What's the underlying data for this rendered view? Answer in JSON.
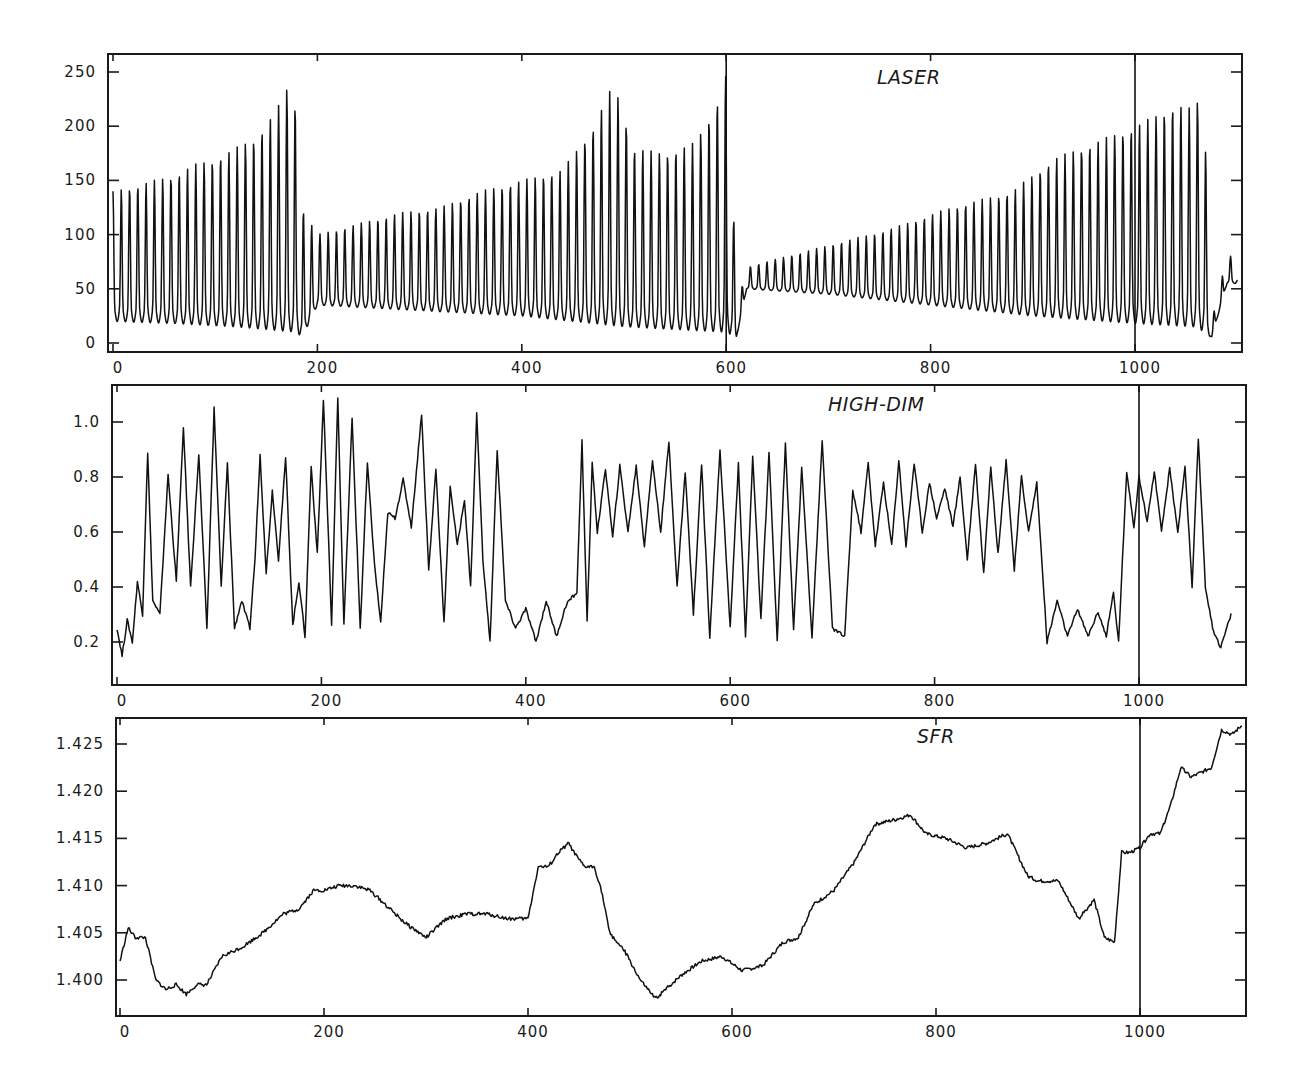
{
  "figure": {
    "panels": [
      {
        "id": "laser",
        "title": "LASER"
      },
      {
        "id": "high-dim",
        "title": "HIGH-DIM"
      },
      {
        "id": "sfr",
        "title": "SFR"
      }
    ]
  },
  "chart_data": [
    {
      "type": "line",
      "title": "LASER",
      "xlabel": "",
      "ylabel": "",
      "xlim": [
        0,
        1100
      ],
      "ylim": [
        -8,
        262
      ],
      "x_ticks": [
        0,
        200,
        400,
        600,
        800,
        1000
      ],
      "y_ticks": [
        0,
        50,
        100,
        150,
        200,
        250
      ],
      "grid": false,
      "vertical_markers": [
        600,
        1000
      ],
      "description": "Periodic pulsations (period ~8) with slowly growing amplitude that collapse at ~x=182, ~x=605 and ~x=1065",
      "envelope_peaks": {
        "x": [
          0,
          20,
          40,
          60,
          80,
          100,
          120,
          140,
          160,
          170,
          180,
          185,
          200,
          240,
          280,
          320,
          360,
          400,
          440,
          470,
          490,
          510,
          540,
          570,
          590,
          603,
          610,
          620,
          660,
          700,
          760,
          820,
          880,
          920,
          960,
          1000,
          1040,
          1060,
          1066,
          1075,
          1090,
          1100
        ],
        "values": [
          140,
          145,
          150,
          155,
          165,
          170,
          180,
          190,
          215,
          235,
          217,
          125,
          100,
          110,
          120,
          125,
          140,
          150,
          160,
          200,
          240,
          180,
          175,
          185,
          220,
          258,
          30,
          70,
          80,
          90,
          105,
          125,
          140,
          170,
          185,
          200,
          220,
          215,
          262,
          20,
          80,
          80
        ]
      },
      "envelope_troughs": {
        "x": [
          0,
          60,
          120,
          180,
          185,
          200,
          300,
          400,
          500,
          600,
          610,
          620,
          700,
          800,
          900,
          1000,
          1060,
          1075,
          1090,
          1100
        ],
        "values": [
          20,
          18,
          15,
          10,
          5,
          35,
          30,
          25,
          15,
          10,
          5,
          50,
          45,
          35,
          25,
          18,
          15,
          5,
          55,
          55
        ]
      }
    },
    {
      "type": "line",
      "title": "HIGH-DIM",
      "xlabel": "",
      "ylabel": "",
      "xlim": [
        0,
        1100
      ],
      "ylim": [
        0.05,
        1.12
      ],
      "x_ticks": [
        0,
        200,
        400,
        600,
        800,
        1000
      ],
      "y_ticks": [
        0.2,
        0.4,
        0.6,
        0.8,
        1.0
      ],
      "grid": false,
      "vertical_markers": [
        1000
      ],
      "x": [
        0,
        5,
        10,
        15,
        20,
        25,
        30,
        35,
        42,
        50,
        58,
        65,
        72,
        80,
        88,
        95,
        102,
        108,
        115,
        122,
        130,
        135,
        140,
        146,
        152,
        158,
        165,
        172,
        178,
        184,
        190,
        196,
        202,
        210,
        216,
        222,
        230,
        238,
        245,
        252,
        258,
        265,
        272,
        280,
        288,
        292,
        298,
        305,
        312,
        320,
        326,
        333,
        340,
        346,
        352,
        358,
        365,
        372,
        380,
        390,
        400,
        410,
        420,
        430,
        440,
        450,
        455,
        460,
        465,
        470,
        478,
        485,
        492,
        500,
        508,
        516,
        524,
        532,
        540,
        548,
        556,
        564,
        572,
        580,
        590,
        600,
        608,
        615,
        622,
        630,
        638,
        646,
        654,
        662,
        670,
        680,
        690,
        700,
        712,
        720,
        728,
        735,
        742,
        750,
        758,
        765,
        772,
        780,
        788,
        795,
        802,
        810,
        818,
        825,
        832,
        840,
        848,
        855,
        862,
        870,
        878,
        885,
        892,
        900,
        910,
        920,
        930,
        940,
        950,
        960,
        968,
        975,
        980,
        988,
        995,
        1000,
        1008,
        1015,
        1022,
        1030,
        1038,
        1045,
        1052,
        1058,
        1065,
        1072,
        1080,
        1090,
        1100
      ],
      "values": [
        0.25,
        0.15,
        0.28,
        0.2,
        0.42,
        0.3,
        0.89,
        0.35,
        0.3,
        0.81,
        0.42,
        0.98,
        0.4,
        0.88,
        0.25,
        1.05,
        0.4,
        0.85,
        0.25,
        0.35,
        0.25,
        0.5,
        0.88,
        0.45,
        0.75,
        0.5,
        0.87,
        0.26,
        0.42,
        0.22,
        0.84,
        0.52,
        1.08,
        0.26,
        1.09,
        0.26,
        1.01,
        0.25,
        0.85,
        0.48,
        0.27,
        0.67,
        0.65,
        0.79,
        0.62,
        0.78,
        1.03,
        0.46,
        0.83,
        0.27,
        0.77,
        0.55,
        0.72,
        0.4,
        1.03,
        0.5,
        0.2,
        0.9,
        0.35,
        0.25,
        0.32,
        0.2,
        0.35,
        0.22,
        0.34,
        0.38,
        0.93,
        0.27,
        0.85,
        0.6,
        0.83,
        0.58,
        0.84,
        0.6,
        0.84,
        0.55,
        0.86,
        0.6,
        0.93,
        0.4,
        0.82,
        0.3,
        0.85,
        0.22,
        0.9,
        0.25,
        0.85,
        0.22,
        0.88,
        0.28,
        0.89,
        0.2,
        0.92,
        0.25,
        0.83,
        0.22,
        0.93,
        0.25,
        0.22,
        0.75,
        0.6,
        0.85,
        0.55,
        0.78,
        0.55,
        0.86,
        0.55,
        0.85,
        0.6,
        0.78,
        0.65,
        0.76,
        0.62,
        0.8,
        0.5,
        0.85,
        0.45,
        0.84,
        0.52,
        0.86,
        0.46,
        0.8,
        0.6,
        0.78,
        0.2,
        0.35,
        0.22,
        0.32,
        0.22,
        0.31,
        0.22,
        0.38,
        0.2,
        0.82,
        0.62,
        0.8,
        0.64,
        0.82,
        0.6,
        0.83,
        0.6,
        0.84,
        0.4,
        0.94,
        0.4,
        0.25,
        0.18,
        0.3
      ]
    },
    {
      "type": "line",
      "title": "SFR",
      "xlabel": "",
      "ylabel": "",
      "xlim": [
        0,
        1100
      ],
      "ylim": [
        1.3962,
        1.4277
      ],
      "x_ticks": [
        0,
        200,
        400,
        600,
        800,
        1000
      ],
      "y_ticks": [
        1.4,
        1.405,
        1.41,
        1.415,
        1.42,
        1.425
      ],
      "grid": false,
      "vertical_markers": [
        1000
      ],
      "x": [
        0,
        8,
        15,
        25,
        35,
        45,
        55,
        65,
        75,
        85,
        100,
        120,
        140,
        160,
        175,
        190,
        200,
        215,
        230,
        245,
        260,
        280,
        300,
        320,
        340,
        360,
        380,
        400,
        410,
        420,
        430,
        440,
        445,
        455,
        465,
        472,
        480,
        495,
        510,
        525,
        535,
        550,
        570,
        590,
        610,
        630,
        650,
        665,
        680,
        700,
        720,
        740,
        760,
        775,
        790,
        810,
        830,
        850,
        870,
        890,
        900,
        920,
        940,
        955,
        965,
        975,
        982,
        990,
        1000,
        1010,
        1020,
        1030,
        1040,
        1050,
        1060,
        1070,
        1080,
        1090,
        1100
      ],
      "values": [
        1.402,
        1.4055,
        1.4045,
        1.4045,
        1.4,
        1.399,
        1.3995,
        1.3985,
        1.3995,
        1.3995,
        1.4025,
        1.4035,
        1.405,
        1.407,
        1.4075,
        1.4095,
        1.4095,
        1.41,
        1.41,
        1.4095,
        1.408,
        1.406,
        1.4045,
        1.4065,
        1.407,
        1.407,
        1.4065,
        1.4065,
        1.412,
        1.412,
        1.4135,
        1.4145,
        1.4135,
        1.412,
        1.412,
        1.4095,
        1.405,
        1.403,
        1.4,
        1.398,
        1.399,
        1.4005,
        1.402,
        1.4025,
        1.401,
        1.4015,
        1.404,
        1.4045,
        1.408,
        1.4095,
        1.4125,
        1.4165,
        1.417,
        1.4175,
        1.4155,
        1.415,
        1.414,
        1.4145,
        1.4155,
        1.411,
        1.4105,
        1.4105,
        1.4065,
        1.4085,
        1.4045,
        1.404,
        1.4135,
        1.4135,
        1.414,
        1.4155,
        1.4155,
        1.4185,
        1.4225,
        1.4215,
        1.422,
        1.4225,
        1.4265,
        1.426,
        1.427
      ]
    }
  ]
}
